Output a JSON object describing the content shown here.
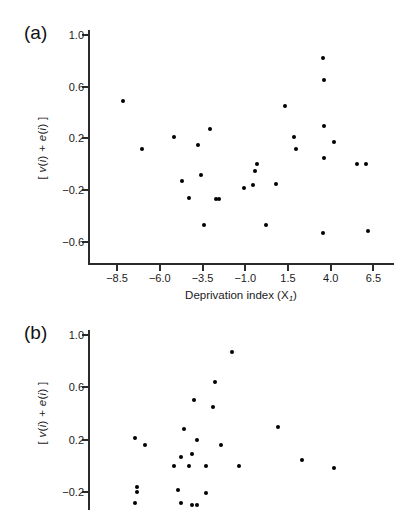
{
  "figure": {
    "background": "#ffffff",
    "marker_color": "#000000",
    "axis_color": "#2b2b2b"
  },
  "panels": [
    {
      "letter": "(a)",
      "xlabel": "Deprivation index (X",
      "xlabel_sub": "1",
      "xlabel_tail": ")",
      "ylabel": "[ v(i) + e(i) ]"
    },
    {
      "letter": "(b)",
      "xlabel": "",
      "ylabel": "[ v(i) + e(i) ]"
    }
  ],
  "chart_data": [
    {
      "type": "scatter",
      "panel": "(a)",
      "title": "",
      "xlabel": "Deprivation index (X1)",
      "ylabel": "[ v(i) + e(i) ]",
      "xticks": [
        -8.5,
        -6.0,
        -3.5,
        -1.0,
        1.5,
        4.0,
        6.5
      ],
      "xticklabels": [
        "−8.5",
        "−6.0",
        "−3.5",
        "−1.0",
        "1.5",
        "4.0",
        "6.5"
      ],
      "yticks": [
        1.0,
        0.6,
        0.2,
        -0.2,
        -0.6
      ],
      "yticklabels": [
        "1.0",
        "0.6",
        "0.2",
        "−0.2",
        "−0.6"
      ],
      "xlim": [
        -10.2,
        7.7
      ],
      "ylim": [
        -0.78,
        1.04
      ],
      "grid": false,
      "legend": null,
      "points": [
        {
          "x": -8.15,
          "y": 0.49
        },
        {
          "x": -7.05,
          "y": 0.12
        },
        {
          "x": -5.15,
          "y": 0.21
        },
        {
          "x": -4.7,
          "y": -0.13
        },
        {
          "x": -4.3,
          "y": -0.26
        },
        {
          "x": -3.75,
          "y": 0.15
        },
        {
          "x": -3.6,
          "y": -0.08
        },
        {
          "x": -3.4,
          "y": -0.47
        },
        {
          "x": -3.05,
          "y": 0.27
        },
        {
          "x": -2.7,
          "y": -0.27
        },
        {
          "x": -2.55,
          "y": -0.27
        },
        {
          "x": -1.1,
          "y": -0.18
        },
        {
          "x": -0.55,
          "y": -0.16
        },
        {
          "x": -0.45,
          "y": -0.05
        },
        {
          "x": -0.3,
          "y": 0.0
        },
        {
          "x": 0.2,
          "y": -0.47
        },
        {
          "x": 0.8,
          "y": -0.15
        },
        {
          "x": 1.3,
          "y": 0.45
        },
        {
          "x": 1.85,
          "y": 0.21
        },
        {
          "x": 1.95,
          "y": 0.12
        },
        {
          "x": 3.55,
          "y": 0.82
        },
        {
          "x": 3.6,
          "y": 0.65
        },
        {
          "x": 3.6,
          "y": 0.3
        },
        {
          "x": 3.6,
          "y": 0.05
        },
        {
          "x": 3.55,
          "y": -0.53
        },
        {
          "x": 4.2,
          "y": 0.17
        },
        {
          "x": 5.55,
          "y": 0.0
        },
        {
          "x": 6.05,
          "y": 0.0
        },
        {
          "x": 6.15,
          "y": -0.52
        }
      ]
    },
    {
      "type": "scatter",
      "panel": "(b)",
      "title": "",
      "xlabel": "",
      "ylabel": "[ v(i) + e(i) ]",
      "xticks": [],
      "xticklabels": [],
      "yticks": [
        1.0,
        0.6,
        0.2,
        -0.2
      ],
      "yticklabels": [
        "1.0",
        "0.6",
        "0.2",
        "−0.2"
      ],
      "xlim": [
        0,
        100
      ],
      "ylim": [
        -0.34,
        1.04
      ],
      "grid": false,
      "legend": null,
      "note": "lower portion of panel cropped by image edge",
      "points": [
        {
          "x": 47.0,
          "y": 0.87
        },
        {
          "x": 41.5,
          "y": 0.64
        },
        {
          "x": 34.5,
          "y": 0.5
        },
        {
          "x": 41.0,
          "y": 0.45
        },
        {
          "x": 31.5,
          "y": 0.28
        },
        {
          "x": 15.5,
          "y": 0.21
        },
        {
          "x": 35.5,
          "y": 0.2
        },
        {
          "x": 18.5,
          "y": 0.16
        },
        {
          "x": 43.5,
          "y": 0.16
        },
        {
          "x": 62.0,
          "y": 0.3
        },
        {
          "x": 34.0,
          "y": 0.09
        },
        {
          "x": 30.5,
          "y": 0.07
        },
        {
          "x": 28.0,
          "y": 0.0
        },
        {
          "x": 33.0,
          "y": 0.0
        },
        {
          "x": 38.5,
          "y": 0.0
        },
        {
          "x": 49.5,
          "y": 0.0
        },
        {
          "x": 70.0,
          "y": 0.04
        },
        {
          "x": 80.5,
          "y": -0.02
        },
        {
          "x": 16.0,
          "y": -0.16
        },
        {
          "x": 16.0,
          "y": -0.2
        },
        {
          "x": 29.5,
          "y": -0.19
        },
        {
          "x": 38.5,
          "y": -0.21
        },
        {
          "x": 15.5,
          "y": -0.29
        },
        {
          "x": 30.5,
          "y": -0.29
        },
        {
          "x": 34.0,
          "y": -0.3
        },
        {
          "x": 35.5,
          "y": -0.3
        }
      ]
    }
  ]
}
